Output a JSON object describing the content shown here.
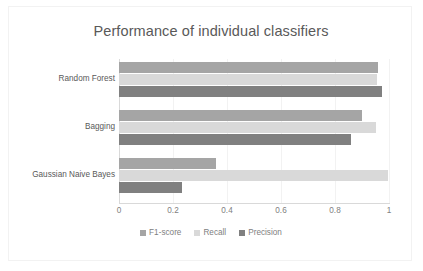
{
  "chart_data": {
    "type": "bar",
    "orientation": "horizontal",
    "title": "Performance of individual classifiers",
    "xlabel": "",
    "ylabel": "",
    "categories": [
      "Random Forest",
      "Bagging",
      "Gaussian Naive Bayes"
    ],
    "series": [
      {
        "name": "F1-score",
        "color": "#a5a5a5",
        "values": [
          0.96,
          0.9,
          0.36
        ]
      },
      {
        "name": "Recall",
        "color": "#d9d9d9",
        "values": [
          0.955,
          0.95,
          0.995
        ]
      },
      {
        "name": "Precision",
        "color": "#808080",
        "values": [
          0.975,
          0.86,
          0.235
        ]
      }
    ],
    "xlim": [
      0,
      1
    ],
    "xticks": [
      "0",
      "0.2",
      "0.4",
      "0.6",
      "0.8",
      "1"
    ],
    "xtick_values": [
      0,
      0.2,
      0.4,
      0.6,
      0.8,
      1
    ],
    "grid": true,
    "grid_axis": "x",
    "legend_position": "bottom"
  },
  "legend": {
    "items": [
      {
        "label": "F1-score",
        "color": "#a5a5a5"
      },
      {
        "label": "Recall",
        "color": "#d9d9d9"
      },
      {
        "label": "Precision",
        "color": "#808080"
      }
    ]
  },
  "colors": {
    "title_text": "#595959",
    "axis_text": "#808080",
    "category_text": "#595959",
    "gridline": "#f2f2f2",
    "axis_line": "#d9d9d9",
    "plot_background": "#ffffff",
    "frame_border": "#f2f2f2"
  }
}
